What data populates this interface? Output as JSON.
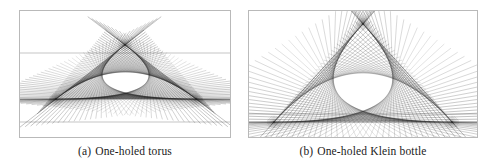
{
  "figure": {
    "background": "#ffffff",
    "line_color": "#202020",
    "frame_color": "#b9b9b9",
    "caption_color": "#1b1b1b"
  },
  "panels": [
    {
      "id": "a",
      "name": "one-holed-torus",
      "caption_tag": "(a)",
      "caption_text": "One-holed torus",
      "viewbox": "0 0 212 128",
      "description": "Line-envelope string figure with three cusps forming a deltoid-like closed curve",
      "cusps": [
        {
          "x": 106,
          "y": 35
        },
        {
          "x": 37,
          "y": 89
        },
        {
          "x": 177,
          "y": 89
        }
      ],
      "baselines": [
        {
          "x1": 1,
          "y1": 43,
          "x2": 211,
          "y2": 43
        },
        {
          "x1": 1,
          "y1": 112,
          "x2": 211,
          "y2": 112
        }
      ],
      "families": [
        {
          "a": [
            106,
            35
          ],
          "b": [
            37,
            89
          ],
          "count": 46,
          "extend": 2.05,
          "weight": 0.32
        },
        {
          "a": [
            37,
            89
          ],
          "b": [
            177,
            89
          ],
          "count": 46,
          "extend": 1.55,
          "weight": 0.32
        },
        {
          "a": [
            177,
            89
          ],
          "b": [
            106,
            35
          ],
          "count": 46,
          "extend": 2.05,
          "weight": 0.32
        }
      ]
    },
    {
      "id": "b",
      "name": "one-holed-klein-bottle",
      "caption_tag": "(b)",
      "caption_text": "One-holed Klein bottle",
      "viewbox": "0 0 230 128",
      "description": "Line-envelope string figure forming an arch with two bottom cusps and a dense crossing node at top center",
      "cusps": [
        {
          "x": 115,
          "y": 14
        },
        {
          "x": 26,
          "y": 112
        },
        {
          "x": 204,
          "y": 112
        }
      ],
      "baselines": [
        {
          "x1": 1,
          "y1": 104,
          "x2": 229,
          "y2": 104
        }
      ],
      "families": [
        {
          "a": [
            115,
            14
          ],
          "b": [
            26,
            112
          ],
          "count": 40,
          "extend": 2.35,
          "weight": 0.34
        },
        {
          "a": [
            115,
            14
          ],
          "b": [
            204,
            112
          ],
          "count": 40,
          "extend": 2.35,
          "weight": 0.34
        },
        {
          "a": [
            26,
            112
          ],
          "b": [
            204,
            112
          ],
          "count": 34,
          "extend": 1.12,
          "weight": 0.3
        }
      ]
    }
  ]
}
